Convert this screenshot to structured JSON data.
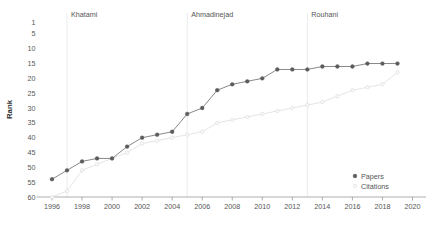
{
  "chart_data": {
    "type": "line",
    "title": "",
    "xlabel": "",
    "ylabel": "Rank",
    "x": [
      1996,
      1997,
      1998,
      1999,
      2000,
      2001,
      2002,
      2003,
      2004,
      2005,
      2006,
      2007,
      2008,
      2009,
      2010,
      2011,
      2012,
      2013,
      2014,
      2015,
      2016,
      2017,
      2018,
      2019
    ],
    "xlim": [
      1995.5,
      2020.5
    ],
    "ylim": [
      60,
      1
    ],
    "y_inverted": true,
    "grid": false,
    "legend_position": "bottom-right",
    "xticks": [
      1996,
      1998,
      2000,
      2002,
      2004,
      2006,
      2008,
      2010,
      2012,
      2014,
      2016,
      2018,
      2020
    ],
    "xticklabels": [
      "1996",
      "1998",
      "2000",
      "2002",
      "2004",
      "2006",
      "2008",
      "2010",
      "2012",
      "2014",
      "2016",
      "2018",
      "2020"
    ],
    "yticks": [
      1,
      5,
      10,
      15,
      20,
      25,
      30,
      35,
      40,
      45,
      50,
      55,
      60
    ],
    "yticklabels": [
      "1",
      "5",
      "10",
      "15",
      "20",
      "25",
      "30",
      "35",
      "40",
      "45",
      "50",
      "55",
      "60"
    ],
    "series": [
      {
        "name": "Papers",
        "color": "#5c5c5c",
        "marker": "filled-circle",
        "values": [
          54,
          51,
          48,
          47,
          47,
          43,
          40,
          39,
          38,
          32,
          30,
          24,
          22,
          21,
          20,
          17,
          17,
          17,
          16,
          16,
          16,
          15,
          15,
          15
        ]
      },
      {
        "name": "Citations",
        "color": "#e2e2e2",
        "marker": "open-circle",
        "values": [
          60,
          58,
          51,
          49,
          47,
          45,
          42,
          41,
          40,
          39,
          38,
          35,
          34,
          33,
          32,
          31,
          30,
          29,
          28,
          26,
          24,
          23,
          22,
          18
        ]
      }
    ],
    "annotations": [
      {
        "label": "Khatami",
        "x": 1997,
        "type": "vline-with-label"
      },
      {
        "label": "Ahmadinejad",
        "x": 2005,
        "type": "vline-with-label"
      },
      {
        "label": "Rouhani",
        "x": 2013,
        "type": "vline-with-label"
      }
    ]
  },
  "legend": {
    "items": [
      {
        "label": "Papers"
      },
      {
        "label": "Citations"
      }
    ]
  },
  "axis": {
    "ylabel": "Rank"
  }
}
